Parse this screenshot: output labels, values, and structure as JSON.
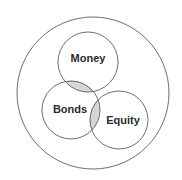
{
  "diagram": {
    "type": "venn",
    "background_color": "#ffffff",
    "stroke_color": "#6e6e6e",
    "overlap_fill_color": "#cfcfcf",
    "label_color": "#2b2b2b",
    "universe": {
      "name": "universe-set",
      "cx": 93,
      "cy": 93,
      "r": 76,
      "label": ""
    },
    "sets": [
      {
        "id": "money",
        "label": "Money",
        "cx": 88,
        "cy": 62,
        "r": 30,
        "label_x": 88,
        "label_y": 59
      },
      {
        "id": "bonds",
        "label": "Bonds",
        "cx": 71,
        "cy": 110,
        "r": 29,
        "label_x": 70,
        "label_y": 110
      },
      {
        "id": "equity",
        "label": "Equity",
        "cx": 119,
        "cy": 120,
        "r": 29,
        "label_x": 123,
        "label_y": 121
      }
    ],
    "overlaps": [
      {
        "id": "money-bonds",
        "between": [
          "money",
          "bonds"
        ],
        "shaded": true
      },
      {
        "id": "bonds-equity",
        "between": [
          "bonds",
          "equity"
        ],
        "shaded": true
      }
    ]
  }
}
